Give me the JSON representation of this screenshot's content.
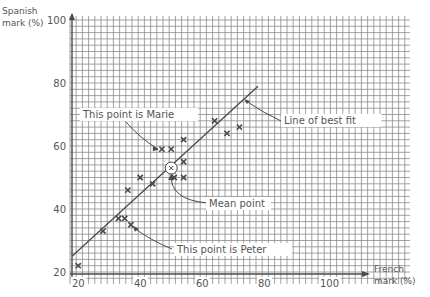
{
  "chart_data": {
    "type": "scatter",
    "title": "",
    "xlabel": "French mark (%)",
    "ylabel": "Spanish mark (%)",
    "xlim": [
      20,
      120
    ],
    "ylim": [
      20,
      100
    ],
    "x_ticks": [
      "20",
      "40",
      "60",
      "80",
      "100"
    ],
    "y_ticks": [
      "20",
      "40",
      "60",
      "80",
      "100"
    ],
    "grid": true,
    "series": [
      {
        "name": "Students",
        "marker": "x",
        "points": [
          {
            "x": 22,
            "y": 22
          },
          {
            "x": 30,
            "y": 33
          },
          {
            "x": 35,
            "y": 37
          },
          {
            "x": 37,
            "y": 37
          },
          {
            "x": 39,
            "y": 35
          },
          {
            "x": 38,
            "y": 46
          },
          {
            "x": 42,
            "y": 50
          },
          {
            "x": 46,
            "y": 48
          },
          {
            "x": 49,
            "y": 59
          },
          {
            "x": 52,
            "y": 59
          },
          {
            "x": 56,
            "y": 62
          },
          {
            "x": 56,
            "y": 55
          },
          {
            "x": 53,
            "y": 50
          },
          {
            "x": 56,
            "y": 50
          },
          {
            "x": 66,
            "y": 68
          },
          {
            "x": 70,
            "y": 64
          },
          {
            "x": 74,
            "y": 66
          }
        ]
      }
    ],
    "line_of_best_fit": {
      "x1": 20,
      "y1": 25,
      "x2": 80,
      "y2": 79
    },
    "mean_point": {
      "x": 52,
      "y": 53
    },
    "annotations": [
      {
        "text": "This point is Marie",
        "target": {
          "x": 49,
          "y": 59
        }
      },
      {
        "text": "Line of best fit",
        "target": {
          "x": 70,
          "y": 70
        }
      },
      {
        "text": "Mean point",
        "target": {
          "x": 52,
          "y": 53
        }
      },
      {
        "text": "This point is Peter",
        "target": {
          "x": 39,
          "y": 35
        }
      }
    ]
  },
  "axes": {
    "y_label_line1": "Spanish",
    "y_label_line2": "mark (%)",
    "x_label_line1": "French",
    "x_label_line2": "mark (%)"
  },
  "labels": {
    "marie": "This point is Marie",
    "best_fit": "Line of best fit",
    "mean": "Mean point",
    "peter": "This point is Peter"
  },
  "colors": {
    "grid": "#8a8a8a",
    "ink": "#4a4a4a",
    "text": "#555555"
  }
}
